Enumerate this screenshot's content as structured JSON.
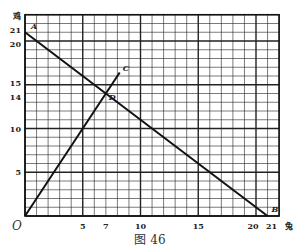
{
  "figure": {
    "caption": "图 46",
    "y_axis_label": "鸡",
    "x_axis_label": "兔",
    "origin_label": "O",
    "x_ticks": [
      "5",
      "7",
      "10",
      "15",
      "20",
      "21"
    ],
    "y_ticks": [
      "21",
      "20",
      "15",
      "14",
      "10",
      "5"
    ],
    "points": {
      "A": "A",
      "B": "B",
      "C": "C",
      "D": "D"
    }
  },
  "chart_data": {
    "type": "line",
    "title": "图 46",
    "xlabel": "兔",
    "ylabel": "鸡",
    "xlim": [
      0,
      22
    ],
    "ylim": [
      0,
      23
    ],
    "grid": true,
    "series": [
      {
        "name": "AB",
        "x": [
          0,
          21
        ],
        "y": [
          21,
          0
        ]
      },
      {
        "name": "OC",
        "x": [
          0,
          8.2
        ],
        "y": [
          0,
          16.4
        ]
      }
    ],
    "annotations": [
      {
        "label": "A",
        "x": 0,
        "y": 21
      },
      {
        "label": "B",
        "x": 21,
        "y": 0
      },
      {
        "label": "C",
        "x": 8.2,
        "y": 16.4
      },
      {
        "label": "D",
        "x": 7,
        "y": 14
      }
    ]
  }
}
